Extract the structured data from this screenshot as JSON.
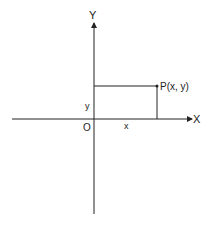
{
  "diagram": {
    "type": "cartesian-coordinate-plane",
    "axes": {
      "x_label": "X",
      "y_label": "Y",
      "origin_label": "O"
    },
    "point": {
      "label": "P(x, y)"
    },
    "projections": {
      "x_label": "x",
      "y_label": "y"
    },
    "colors": {
      "line": "#222222",
      "background": "#ffffff"
    }
  }
}
